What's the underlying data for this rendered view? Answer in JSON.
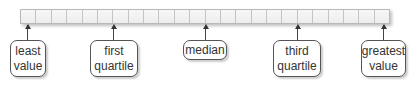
{
  "diagram": {
    "strip": {
      "cell_count": 24,
      "fill_color": "#f4f4f4",
      "border_color": "#b8b8b8"
    },
    "labels": [
      {
        "id": "least-value",
        "lines": [
          "least",
          "value"
        ],
        "arrow_x": 27,
        "box_left": 10,
        "box_width": 36,
        "box_height": 37
      },
      {
        "id": "first-quartile",
        "lines": [
          "first",
          "quartile"
        ],
        "arrow_x": 113,
        "box_left": 90,
        "box_width": 48,
        "box_height": 37
      },
      {
        "id": "median",
        "lines": [
          "median"
        ],
        "arrow_x": 205,
        "box_left": 183,
        "box_width": 44,
        "box_height": 20
      },
      {
        "id": "third-quartile",
        "lines": [
          "third",
          "quartile"
        ],
        "arrow_x": 297,
        "box_left": 273,
        "box_width": 48,
        "box_height": 37
      },
      {
        "id": "greatest-value",
        "lines": [
          "greatest",
          "value"
        ],
        "arrow_x": 383,
        "box_left": 361,
        "box_width": 45,
        "box_height": 37
      }
    ]
  }
}
